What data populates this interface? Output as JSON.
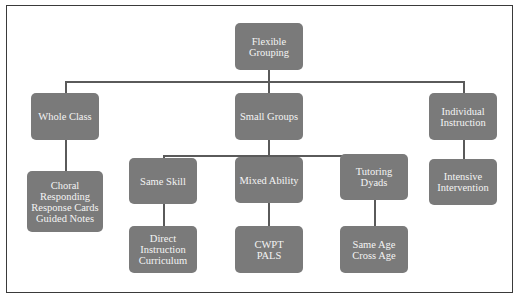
{
  "diagram": {
    "type": "tree",
    "root": {
      "label": "Flexible\nGrouping",
      "children": [
        {
          "label": "Whole Class",
          "children": [
            {
              "label": "Choral\nResponding\nResponse Cards\nGuided Notes"
            }
          ]
        },
        {
          "label": "Small Groups",
          "children": [
            {
              "label": "Same Skill",
              "children": [
                {
                  "label": "Direct\nInstruction\nCurriculum"
                }
              ]
            },
            {
              "label": "Mixed Ability",
              "children": [
                {
                  "label": "CWPT\nPALS"
                }
              ]
            },
            {
              "label": "Tutoring\nDyads",
              "children": [
                {
                  "label": "Same Age\nCross Age"
                }
              ]
            }
          ]
        },
        {
          "label": "Individual\nInstruction",
          "children": [
            {
              "label": "Intensive\nIntervention"
            }
          ]
        }
      ]
    }
  },
  "nodes": {
    "flexible_grouping": "Flexible\nGrouping",
    "whole_class": "Whole Class",
    "small_groups": "Small Groups",
    "individual_instruction": "Individual\nInstruction",
    "choral": "Choral\nResponding\nResponse Cards\nGuided Notes",
    "same_skill": "Same Skill",
    "mixed_ability": "Mixed Ability",
    "tutoring_dyads": "Tutoring\nDyads",
    "intensive_intervention": "Intensive\nIntervention",
    "direct_instruction": "Direct\nInstruction\nCurriculum",
    "cwpt_pals": "CWPT\nPALS",
    "same_cross_age": "Same Age\nCross Age"
  },
  "colors": {
    "node_fill": "#7a7a7a",
    "node_text": "#f4f4f4",
    "connector": "#5a5a5a",
    "frame": "#3a3a3a"
  }
}
